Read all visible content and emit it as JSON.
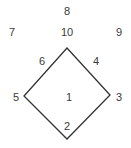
{
  "diagram": {
    "type": "baseball-position-numbers",
    "line_color": "#333333",
    "text_color": "#3a3a3a",
    "diamond": {
      "vertices": {
        "top": [
          67,
          48
        ],
        "right": [
          110,
          95
        ],
        "bottom": [
          67,
          139
        ],
        "left": [
          24,
          96
        ]
      }
    },
    "labels": [
      {
        "id": "center-field",
        "text": "8",
        "x": 67,
        "y": 11
      },
      {
        "id": "left-field",
        "text": "7",
        "x": 12,
        "y": 32
      },
      {
        "id": "short-center",
        "text": "10",
        "x": 67,
        "y": 32
      },
      {
        "id": "right-field",
        "text": "9",
        "x": 119,
        "y": 32
      },
      {
        "id": "shortstop",
        "text": "6",
        "x": 42,
        "y": 61
      },
      {
        "id": "second-base",
        "text": "4",
        "x": 96,
        "y": 61
      },
      {
        "id": "third-base",
        "text": "5",
        "x": 16,
        "y": 97
      },
      {
        "id": "pitcher",
        "text": "1",
        "x": 69,
        "y": 97
      },
      {
        "id": "first-base",
        "text": "3",
        "x": 119,
        "y": 97
      },
      {
        "id": "catcher",
        "text": "2",
        "x": 67,
        "y": 126
      }
    ]
  }
}
